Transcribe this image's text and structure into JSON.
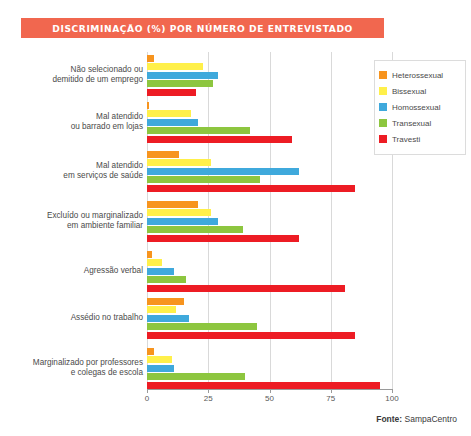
{
  "title": "DISCRIMINAÇÃO (%) POR NÚMERO DE ENTREVISTADO",
  "colors": {
    "banner": "#F1674F",
    "heterossexual": "#F7941E",
    "bissexual": "#FFF04A",
    "homossexual": "#3FA9DC",
    "transexual": "#8DC63F",
    "travesti": "#ED1C24",
    "gridline": "#d9d9d9",
    "axis": "#9a9a9a"
  },
  "legend": {
    "position": "right",
    "items": [
      {
        "label": "Heterossexual",
        "color": "#F7941E"
      },
      {
        "label": "Bissexual",
        "color": "#FFF04A"
      },
      {
        "label": "Homossexual",
        "color": "#3FA9DC"
      },
      {
        "label": "Transexual",
        "color": "#8DC63F"
      },
      {
        "label": "Travesti",
        "color": "#ED1C24"
      }
    ]
  },
  "source": {
    "label": "Fonte:",
    "value": "SampaCentro"
  },
  "chart_data": {
    "type": "bar",
    "orientation": "horizontal",
    "title": "DISCRIMINAÇÃO (%) POR NÚMERO DE ENTREVISTADO",
    "xlabel": "",
    "ylabel": "",
    "xlim": [
      0,
      100
    ],
    "xticks": [
      0,
      25,
      50,
      75,
      100
    ],
    "xtick_labels": [
      "0",
      "25",
      "50",
      "75",
      "100"
    ],
    "grid": true,
    "categories": [
      "Não selecionado ou demitido de um emprego",
      "Mal atendido ou barrado em lojas",
      "Mal atendido em serviços de saúde",
      "Excluído ou marginalizado em ambiente familiar",
      "Agressão verbal",
      "Assédio no trabalho",
      "Marginalizado por professores e colegas de escola"
    ],
    "category_lines": [
      [
        "Não selecionado ou",
        "demitido de um emprego"
      ],
      [
        "Mal atendido",
        "ou barrado em lojas"
      ],
      [
        "Mal atendido",
        "em serviços de saúde"
      ],
      [
        "Excluído ou marginalizado",
        "em ambiente familiar"
      ],
      [
        "Agressão verbal"
      ],
      [
        "Assédio no trabalho"
      ],
      [
        "Marginalizado por professores",
        "e colegas de escola"
      ]
    ],
    "series": [
      {
        "name": "Heterossexual",
        "color": "#F7941E",
        "values": [
          3,
          1,
          13,
          21,
          2,
          15,
          3
        ]
      },
      {
        "name": "Bissexual",
        "color": "#FFF04A",
        "values": [
          23,
          18,
          26,
          26,
          6,
          12,
          10
        ]
      },
      {
        "name": "Homossexual",
        "color": "#3FA9DC",
        "values": [
          29,
          21,
          62,
          29,
          11,
          17,
          11
        ]
      },
      {
        "name": "Transexual",
        "color": "#8DC63F",
        "values": [
          27,
          42,
          46,
          39,
          16,
          45,
          40
        ]
      },
      {
        "name": "Travesti",
        "color": "#ED1C24",
        "values": [
          20,
          59,
          85,
          62,
          81,
          85,
          95
        ]
      }
    ]
  }
}
